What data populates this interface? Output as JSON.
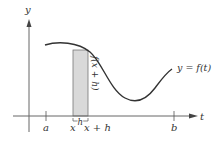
{
  "diagram": {
    "axes": {
      "x_label": "t",
      "y_label": "y"
    },
    "curve_label": "y = f(t)",
    "rectangle_height_label": "f(x + h)",
    "width_label": "h",
    "ticks": [
      {
        "label": "a"
      },
      {
        "label": "x"
      },
      {
        "label": "x + h"
      },
      {
        "label": "b"
      }
    ],
    "colors": {
      "curve": "#333333",
      "axis": "#555555",
      "rect_fill": "#d9d9d9",
      "rect_stroke": "#666666"
    }
  }
}
